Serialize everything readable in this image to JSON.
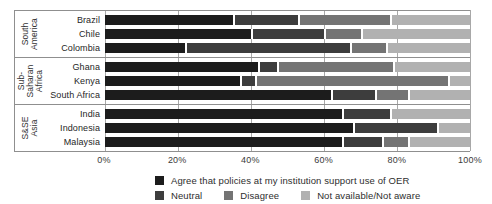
{
  "chart_data": {
    "type": "bar",
    "orientation": "horizontal",
    "stacked": true,
    "unit": "percent",
    "xlim": [
      0,
      100
    ],
    "x_ticks": [
      "0%",
      "20%",
      "40%",
      "60%",
      "80%",
      "100%"
    ],
    "grid": "vertical-lines-on",
    "legend_position": "bottom",
    "series_names": [
      "Agree that policies at my institution support use of OER",
      "Neutral",
      "Disagree",
      "Not available/Not aware"
    ],
    "series_keys": [
      "agree",
      "neutral",
      "disagree",
      "not-available"
    ],
    "series_colors": [
      "#1c1c1c",
      "#3d3d3d",
      "#747474",
      "#b1b1b1"
    ],
    "groups": [
      {
        "region": "South\nAmerica",
        "countries": [
          {
            "name": "Brazil",
            "values": [
              35,
              18,
              25,
              22
            ]
          },
          {
            "name": "Chile",
            "values": [
              40,
              20,
              10,
              30
            ]
          },
          {
            "name": "Colombia",
            "values": [
              22,
              45,
              10,
              23
            ]
          }
        ]
      },
      {
        "region": "Sub-\nSaharan\nAfrica",
        "countries": [
          {
            "name": "Ghana",
            "values": [
              42,
              5,
              32,
              21
            ]
          },
          {
            "name": "Kenya",
            "values": [
              37,
              4,
              53,
              6
            ]
          },
          {
            "name": "South Africa",
            "values": [
              62,
              12,
              9,
              17
            ]
          }
        ]
      },
      {
        "region": "S&SE\nAsia",
        "countries": [
          {
            "name": "India",
            "values": [
              65,
              13,
              0,
              22
            ]
          },
          {
            "name": "Indonesia",
            "values": [
              68,
              23,
              0,
              9
            ]
          },
          {
            "name": "Malaysia",
            "values": [
              65,
              11,
              7,
              17
            ]
          }
        ]
      }
    ]
  }
}
